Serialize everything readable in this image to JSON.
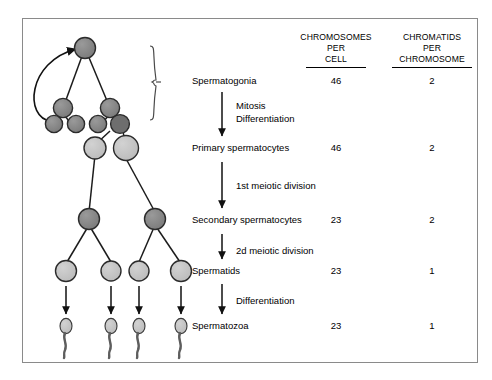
{
  "figure": {
    "title_present": false,
    "border_color": "#8a8a8a",
    "background": "#ffffff"
  },
  "columns": {
    "col1": {
      "line1": "CHROMOSOMES",
      "line2": "PER",
      "line3": "CELL"
    },
    "col2": {
      "line1": "CHROMATIDS",
      "line2": "PER",
      "line3": "CHROMOSOME"
    }
  },
  "stages": [
    {
      "label": "Spermatogonia",
      "chromosomes_per_cell": "46",
      "chromatids_per_chromosome": "2"
    },
    {
      "label": "Primary spermatocytes",
      "chromosomes_per_cell": "46",
      "chromatids_per_chromosome": "2"
    },
    {
      "label": "Secondary spermatocytes",
      "chromosomes_per_cell": "23",
      "chromatids_per_chromosome": "2"
    },
    {
      "label": "Spermatids",
      "chromosomes_per_cell": "23",
      "chromatids_per_chromosome": "1"
    },
    {
      "label": "Spermatozoa",
      "chromosomes_per_cell": "23",
      "chromatids_per_chromosome": "1"
    }
  ],
  "processes": [
    {
      "line1": "Mitosis",
      "line2": "Differentiation"
    },
    {
      "line1": "1st meiotic division",
      "line2": ""
    },
    {
      "line1": "2d meiotic division",
      "line2": ""
    },
    {
      "line1": "Differentiation",
      "line2": ""
    }
  ],
  "cells": {
    "dark_fill": "#828282",
    "light_fill": "#c2c2c2",
    "stroke": "#2b2b2b",
    "groups": {
      "stem_cell": 1,
      "spermatogonia_mid": 2,
      "spermatogonia_row": 4,
      "primary_spermatocytes": 2,
      "secondary_spermatocytes": 2,
      "spermatids": 4,
      "spermatozoa": 4
    }
  },
  "annotations": {
    "brace": "spermatogonia-grouping-brace",
    "feedback_arrow": "self-renewal-arrow"
  }
}
